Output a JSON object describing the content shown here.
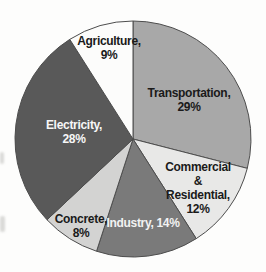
{
  "chart_data": {
    "type": "pie",
    "title": "",
    "unit": "%",
    "direction": "clockwise",
    "start_angle_deg": 0,
    "outline_color": "#4d4d4d",
    "background_color": "#fdfdfc",
    "slices": [
      {
        "name": "Transportation",
        "value": 29,
        "color": "#a8a8a8",
        "label": "Transportation,\n29%",
        "label_color": "#1a1a1a"
      },
      {
        "name": "Commercial & Residential",
        "value": 12,
        "color": "#e8e8e7",
        "label": "Commercial &\nResidential,\n12%",
        "label_color": "#1a1a1a"
      },
      {
        "name": "Industry",
        "value": 14,
        "color": "#7a7a7a",
        "label": "Industry, 14%",
        "label_color": "#f2f2f2"
      },
      {
        "name": "Concrete",
        "value": 8,
        "color": "#d3d3d2",
        "label": "Concrete,\n8%",
        "label_color": "#1a1a1a"
      },
      {
        "name": "Electricity",
        "value": 28,
        "color": "#595959",
        "label": "Electricity,\n28%",
        "label_color": "#f7f7f7"
      },
      {
        "name": "Agriculture",
        "value": 9,
        "color": "#fcfcfb",
        "label": "Agriculture,\n9%",
        "label_color": "#1a1a1a"
      }
    ],
    "geometry": {
      "cx": 133,
      "cy": 139,
      "r": 118
    }
  }
}
